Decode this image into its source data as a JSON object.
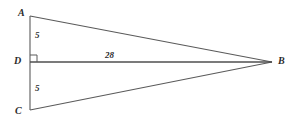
{
  "figure": {
    "kind": "geometry-diagram",
    "background_color": "#ffffff",
    "stroke_color": "#5a5a5a",
    "text_color": "#2b2b2b",
    "vertices": [
      {
        "id": "A",
        "label": "A",
        "x": 30,
        "y": 16
      },
      {
        "id": "D",
        "label": "D",
        "x": 30,
        "y": 62
      },
      {
        "id": "C",
        "label": "C",
        "x": 30,
        "y": 110
      },
      {
        "id": "B",
        "label": "B",
        "x": 272,
        "y": 62
      }
    ],
    "segments": [
      {
        "id": "AB",
        "from": "A",
        "to": "B",
        "label": ""
      },
      {
        "id": "AC",
        "from": "A",
        "to": "C",
        "label": ""
      },
      {
        "id": "DB",
        "from": "D",
        "to": "B",
        "label": "28"
      },
      {
        "id": "CB",
        "from": "C",
        "to": "B",
        "label": ""
      }
    ],
    "measurements": {
      "AD": "5",
      "DC": "5",
      "DB": "28"
    },
    "right_angle_marks": [
      {
        "at": "D",
        "size": 7
      }
    ]
  }
}
